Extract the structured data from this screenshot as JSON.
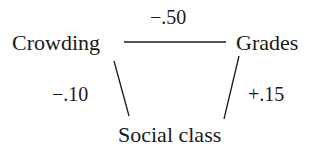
{
  "diagram": {
    "nodes": {
      "crowding": "Crowding",
      "grades": "Grades",
      "social_class": "Social class"
    },
    "edges": {
      "crowding_grades": "−.50",
      "crowding_social_class": "−.10",
      "grades_social_class": "+.15"
    },
    "colors": {
      "text": "#1a1a1a",
      "background": "#ffffff"
    }
  }
}
